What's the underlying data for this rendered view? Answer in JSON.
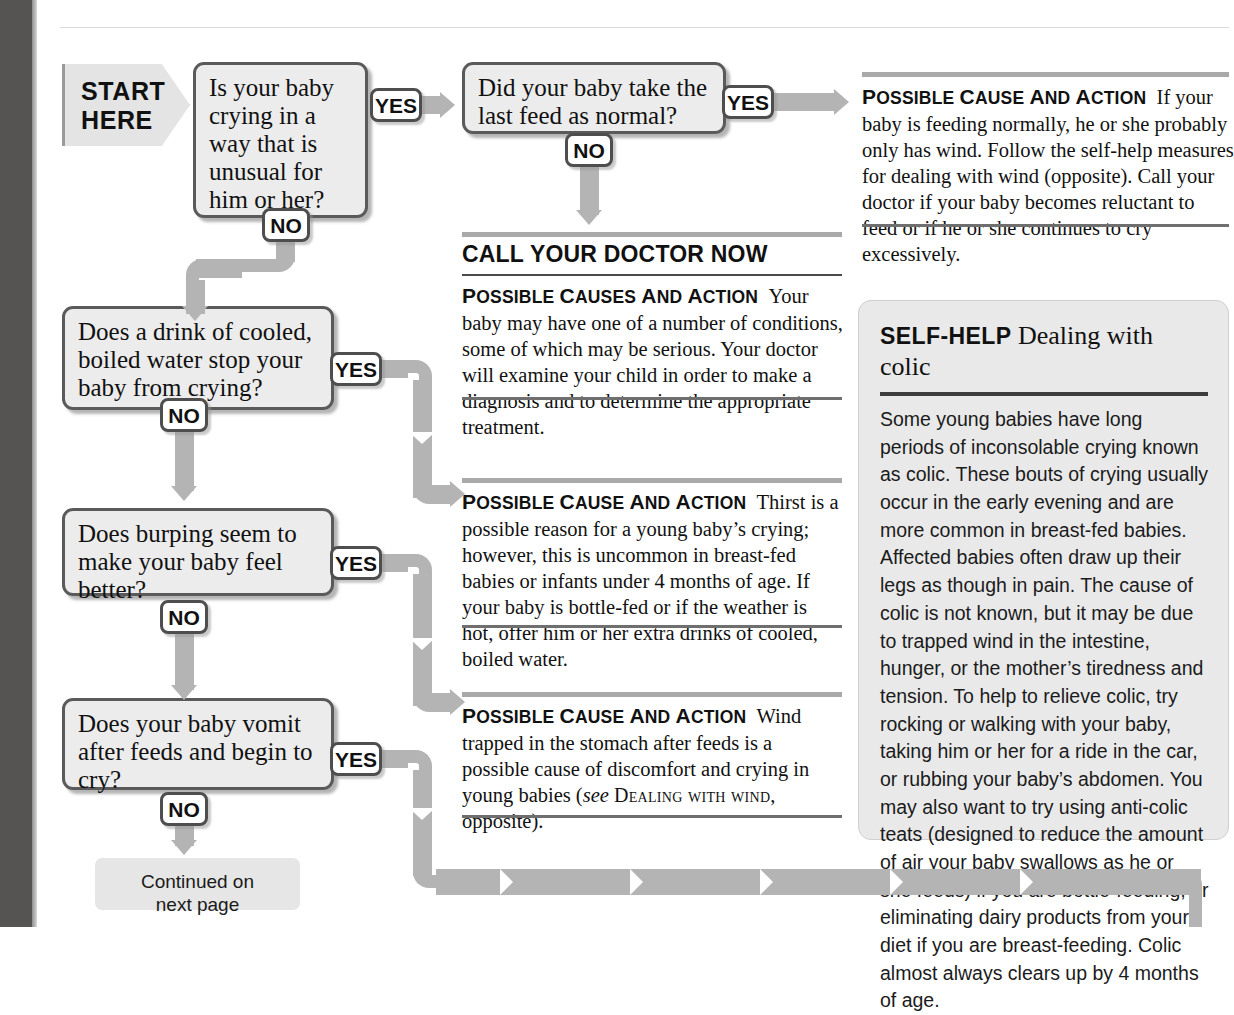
{
  "page": {
    "gutter_color": "#555453",
    "connector_color": "#b4b4b4",
    "box_fill": "#ececec",
    "box_border": "#5a5a5a"
  },
  "start": {
    "line1": "START",
    "line2": "HERE"
  },
  "labels": {
    "yes": "YES",
    "no": "NO"
  },
  "questions": [
    {
      "id": "q1",
      "text": "Is your baby crying in a way that is unusual for him or her?"
    },
    {
      "id": "q2",
      "text": "Did your baby take the last feed as normal?"
    },
    {
      "id": "q3",
      "text": "Does a drink of cooled, boiled water stop your baby from crying?"
    },
    {
      "id": "q4",
      "text": "Does burping seem to make your baby feel better?"
    },
    {
      "id": "q5",
      "text": "Does your baby vomit after feeds and begin to cry?"
    }
  ],
  "continued": {
    "line1": "Continued on",
    "line2": "next page"
  },
  "blocks": {
    "wind_top": {
      "lead": "Possible cause and action",
      "body": "If your baby is feeding normally, he or she probably only has wind. Follow the self-help measures for dealing with wind (opposite). Call your doctor if your baby becomes reluctant to feed or if he or she continues to cry excessively."
    },
    "doctor_now": {
      "heading": "CALL YOUR DOCTOR NOW",
      "lead": "Possible causes and action",
      "body": "Your baby may have one of a number of conditions, some of which may be serious. Your doctor will examine your child in order to make a diagnosis and to determine the appropriate treatment."
    },
    "thirst": {
      "lead": "Possible cause and action",
      "body": "Thirst is a possible reason for a young baby’s crying; however, this is uncommon in breast-fed babies or infants under 4 months of age. If your baby is bottle-fed or if the weather is hot, offer him or her extra drinks of cooled, boiled water."
    },
    "wind_trapped": {
      "lead": "Possible cause and action",
      "body_before": "Wind trapped in the stomach after feeds is a possible cause of discomfort and crying in young babies (",
      "see": "see",
      "crossref": "Dealing with wind",
      "body_after": ", opposite)."
    }
  },
  "selfhelp": {
    "kicker": "SELF-HELP",
    "title": "Dealing with colic",
    "body": "Some young babies have long periods of inconsolable crying known as colic. These bouts of crying usually occur in the early evening and are more common in breast-fed babies. Affected babies often draw up their legs as though in pain. The cause of colic is not known, but it may be due to trapped wind in the intestine, hunger, or the mother’s tiredness and tension. To help to relieve colic, try rocking or walking with your baby, taking him or her for a ride in the car, or rubbing your baby’s abdomen. You may also want to try using anti-colic teats (designed to reduce the amount of air your baby swallows as he or she feeds) if you are bottle-feeding, or eliminating dairy products from your diet if you are breast-feeding. Colic almost always clears up by 4 months of age."
  }
}
